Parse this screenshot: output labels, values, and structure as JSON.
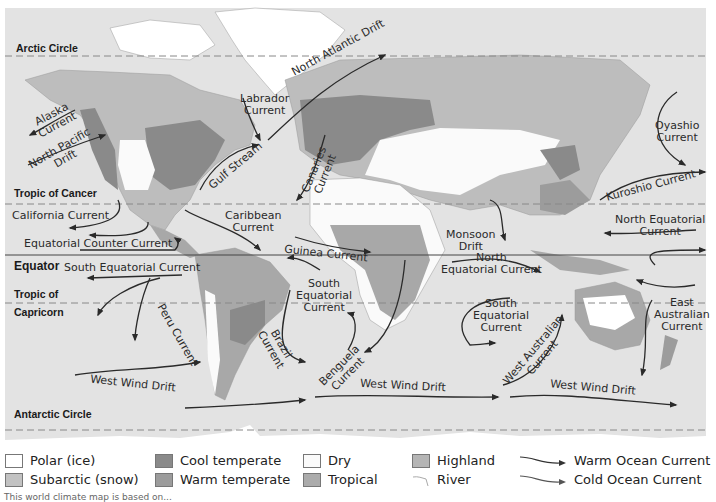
{
  "map": {
    "title": "World Climate Regions and Ocean Currents",
    "colors": {
      "ocean": "#e3e3e3",
      "polar": "#ffffff",
      "subarctic": "#bdbdbd",
      "cool_temperate": "#8a8a8a",
      "warm_temperate": "#9c9c9c",
      "dry": "#fafafa",
      "tropical": "#a8a8a8",
      "highland": "#b3b3b3",
      "current_line": "#333333"
    },
    "latitude_lines": [
      {
        "name": "Arctic Circle",
        "y": 56
      },
      {
        "name": "Tropic of Cancer",
        "y": 204
      },
      {
        "name": "Equator",
        "y": 255
      },
      {
        "name": "Tropic of Capricorn",
        "y": 303
      },
      {
        "name": "Antarctic Circle",
        "y": 430
      }
    ],
    "latitude_labels": {
      "arctic": "Arctic Circle",
      "cancer": "Tropic of Cancer",
      "equator": "Equator",
      "capricorn_1": "Tropic of",
      "capricorn_2": "Capricorn",
      "antarctic": "Antarctic Circle"
    },
    "currents": [
      {
        "id": "labrador",
        "line1": "Labrador",
        "line2": "Current"
      },
      {
        "id": "north-atlantic-drift",
        "line1": "North Atlantic Drift"
      },
      {
        "id": "alaska",
        "line1": "Alaska",
        "line2": "Current"
      },
      {
        "id": "north-pacific-drift",
        "line1": "North Pacific",
        "line2": "Drift"
      },
      {
        "id": "gulf-stream",
        "line1": "Gulf Stream"
      },
      {
        "id": "canaries",
        "line1": "Canaries",
        "line2": "Current"
      },
      {
        "id": "oyashio",
        "line1": "Oyashio",
        "line2": "Current"
      },
      {
        "id": "kuroshio",
        "line1": "Kuroshio Current"
      },
      {
        "id": "california",
        "line1": "California Current"
      },
      {
        "id": "caribbean",
        "line1": "Caribbean",
        "line2": "Current"
      },
      {
        "id": "north-equatorial-pacific",
        "line1": "North Equatorial",
        "line2": "Current"
      },
      {
        "id": "equatorial-counter",
        "line1": "Equatorial Counter Current"
      },
      {
        "id": "monsoon",
        "line1": "Monsoon",
        "line2": "Drift"
      },
      {
        "id": "guinea",
        "line1": "Guinea Current"
      },
      {
        "id": "south-equatorial-pacific",
        "line1": "South Equatorial Current"
      },
      {
        "id": "north-equatorial-indian",
        "line1": "North",
        "line2": "Equatorial Current"
      },
      {
        "id": "south-equatorial-atlantic",
        "line1": "South",
        "line2": "Equatorial",
        "line3": "Current"
      },
      {
        "id": "south-equatorial-indian",
        "line1": "South",
        "line2": "Equatorial",
        "line3": "Current"
      },
      {
        "id": "east-australian",
        "line1": "East",
        "line2": "Australian",
        "line3": "Current"
      },
      {
        "id": "peru",
        "line1": "Peru Current"
      },
      {
        "id": "brazil",
        "line1": "Brazil",
        "line2": "Current"
      },
      {
        "id": "benguela",
        "line1": "Benguela",
        "line2": "Current"
      },
      {
        "id": "west-australian",
        "line1": "West Australian",
        "line2": "Current"
      },
      {
        "id": "west-wind-drift-1",
        "line1": "West Wind Drift"
      },
      {
        "id": "west-wind-drift-2",
        "line1": "West Wind Drift"
      },
      {
        "id": "west-wind-drift-3",
        "line1": "West Wind Drift"
      }
    ]
  },
  "legend": {
    "items": [
      {
        "label": "Polar (ice)",
        "color": "#ffffff"
      },
      {
        "label": "Subarctic (snow)",
        "color": "#c2c2c2"
      },
      {
        "label": "Cool temperate",
        "color": "#8a8a8a"
      },
      {
        "label": "Warm temperate",
        "color": "#9c9c9c"
      },
      {
        "label": "Dry",
        "color": "#fafafa"
      },
      {
        "label": "Tropical",
        "color": "#ababab"
      },
      {
        "label": "Highland",
        "color": "#b5b5b5"
      },
      {
        "label": "River"
      },
      {
        "label": "Warm Ocean Current"
      },
      {
        "label": "Cold Ocean Current"
      }
    ],
    "note": "This world climate map is based on..."
  }
}
